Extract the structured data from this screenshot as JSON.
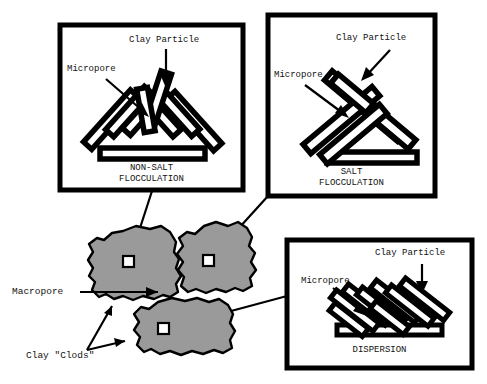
{
  "figure": {
    "type": "soil-clay-microstructure-diagram",
    "background_color": "#ffffff",
    "line_color": "#000000",
    "clod_fill_color": "#9a9a9a",
    "panel_border_color": "#000000",
    "panel_fill_color": "#ffffff"
  },
  "outer_labels": {
    "macropore": "Macropore",
    "clay_clods": "Clay \"Clods\""
  },
  "panels": [
    {
      "id": "non-salt-flocculation",
      "caption_line1": "NON-SALT",
      "caption_line2": "FLOCCULATION",
      "label_clay_particle": "Clay Particle",
      "label_micropore": "Micropore",
      "arrangement": "edge-to-face card-house, fan of bars on base plate",
      "bounds": {
        "x": 60,
        "y": 25,
        "w": 183,
        "h": 165
      }
    },
    {
      "id": "salt-flocculation",
      "caption_line1": "SALT",
      "caption_line2": "FLOCCULATION",
      "label_clay_particle": "Clay Particle",
      "label_micropore": "Micropore",
      "arrangement": "open triangular edge-to-edge stack on base plate",
      "bounds": {
        "x": 268,
        "y": 15,
        "w": 167,
        "h": 181
      }
    },
    {
      "id": "dispersion",
      "caption_line1": "DISPERSION",
      "caption_line2": "",
      "label_clay_particle": "Clay Particle",
      "label_micropore": "Micropore",
      "arrangement": "parallel face-to-face bars leaning right on base plate",
      "bounds": {
        "x": 287,
        "y": 240,
        "w": 185,
        "h": 128
      }
    }
  ],
  "clods": [
    {
      "id": "clod-top-left",
      "marker_square": true,
      "connects_to": "non-salt-flocculation"
    },
    {
      "id": "clod-top-right",
      "marker_square": true,
      "connects_to": "salt-flocculation"
    },
    {
      "id": "clod-bottom",
      "marker_square": true,
      "connects_to": "dispersion"
    }
  ]
}
